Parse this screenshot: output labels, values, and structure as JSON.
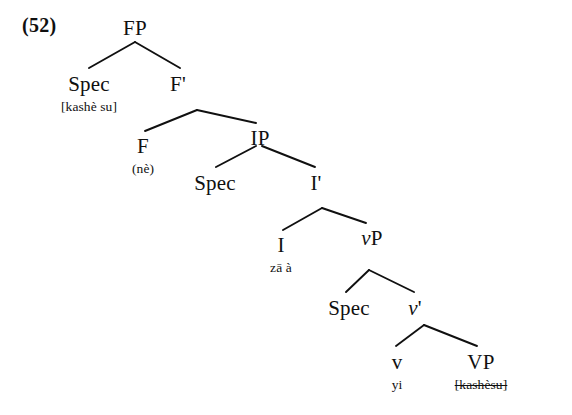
{
  "figure": {
    "example_number": "(52)",
    "ink_color": "#101010",
    "background_color": "#ffffff"
  },
  "nodes": [
    {
      "id": "FP",
      "label": "FP",
      "gloss": "",
      "x": 135,
      "y": 18,
      "italic": false,
      "struck": false
    },
    {
      "id": "Spec_FP",
      "label": "Spec",
      "gloss": "[kashè su]",
      "x": 89,
      "y": 74,
      "italic": false,
      "struck": false
    },
    {
      "id": "Fbar",
      "label": "F'",
      "gloss": "",
      "x": 178,
      "y": 74,
      "italic": false,
      "struck": false
    },
    {
      "id": "F",
      "label": "F",
      "gloss": "(nè)",
      "x": 143,
      "y": 136,
      "italic": false,
      "struck": false
    },
    {
      "id": "IP",
      "label": "IP",
      "gloss": "",
      "x": 260,
      "y": 128,
      "italic": false,
      "struck": false
    },
    {
      "id": "Spec_IP",
      "label": "Spec",
      "gloss": "",
      "x": 215,
      "y": 173,
      "italic": false,
      "struck": false
    },
    {
      "id": "Ibar",
      "label": "I'",
      "gloss": "",
      "x": 316,
      "y": 173,
      "italic": false,
      "struck": false
    },
    {
      "id": "I",
      "label": "I",
      "gloss": "zā à",
      "x": 281,
      "y": 235,
      "italic": false,
      "struck": false
    },
    {
      "id": "vP",
      "label": "vP",
      "gloss": "",
      "x": 372,
      "y": 228,
      "italic": true,
      "struck": false
    },
    {
      "id": "Spec_vP",
      "label": "Spec",
      "gloss": "",
      "x": 349,
      "y": 298,
      "italic": false,
      "struck": false
    },
    {
      "id": "vbar",
      "label": "v'",
      "gloss": "",
      "x": 415,
      "y": 298,
      "italic": true,
      "struck": false
    },
    {
      "id": "v",
      "label": "v",
      "gloss": "yi",
      "x": 397,
      "y": 352,
      "italic": false,
      "struck": false
    },
    {
      "id": "VP",
      "label": "VP",
      "gloss": "[kashèsu]",
      "x": 481,
      "y": 352,
      "italic": false,
      "struck": true
    }
  ],
  "branches": [
    {
      "from": "FP",
      "to": "Spec_FP",
      "x1": 135,
      "y1": 42,
      "x2": 89,
      "y2": 68
    },
    {
      "from": "FP",
      "to": "Fbar",
      "x1": 135,
      "y1": 42,
      "x2": 180,
      "y2": 68
    },
    {
      "from": "Fbar",
      "to": "F",
      "x1": 197,
      "y1": 110,
      "x2": 145,
      "y2": 131
    },
    {
      "from": "Fbar",
      "to": "IP",
      "x1": 197,
      "y1": 110,
      "x2": 256,
      "y2": 123
    },
    {
      "from": "IP",
      "to": "Spec_IP",
      "x1": 256,
      "y1": 146,
      "x2": 216,
      "y2": 167
    },
    {
      "from": "IP",
      "to": "Ibar",
      "x1": 262,
      "y1": 146,
      "x2": 315,
      "y2": 167
    },
    {
      "from": "Ibar",
      "to": "I",
      "x1": 322,
      "y1": 208,
      "x2": 283,
      "y2": 230
    },
    {
      "from": "Ibar",
      "to": "vP",
      "x1": 322,
      "y1": 208,
      "x2": 366,
      "y2": 223
    },
    {
      "from": "vP",
      "to": "Spec_vP",
      "x1": 369,
      "y1": 270,
      "x2": 346,
      "y2": 292
    },
    {
      "from": "vP",
      "to": "vbar",
      "x1": 369,
      "y1": 270,
      "x2": 414,
      "y2": 292
    },
    {
      "from": "vbar",
      "to": "v",
      "x1": 424,
      "y1": 325,
      "x2": 396,
      "y2": 346
    },
    {
      "from": "vbar",
      "to": "VP",
      "x1": 424,
      "y1": 325,
      "x2": 477,
      "y2": 346
    }
  ]
}
